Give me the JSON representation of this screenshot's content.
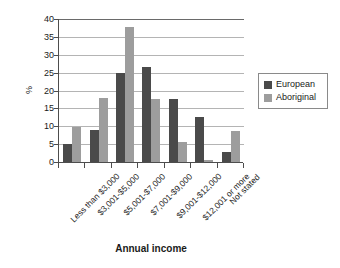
{
  "chart_data": {
    "type": "bar",
    "title": "",
    "xlabel": "Annual income",
    "ylabel": "%",
    "ylim": [
      0,
      40
    ],
    "yticks": [
      0,
      5,
      10,
      15,
      20,
      25,
      30,
      35,
      40
    ],
    "grid": true,
    "legend_position": "right",
    "categories": [
      "Less than $3,000",
      "$3,001-$5,000",
      "$5,001-$7,000",
      "$7,001-$9,000",
      "$9,001-$12,000",
      "$12,001 or more",
      "Not stated"
    ],
    "series": [
      {
        "name": "European",
        "color": "#4a4a4a",
        "values": [
          5.0,
          8.9,
          24.9,
          26.7,
          17.7,
          12.6,
          2.7
        ]
      },
      {
        "name": "Aboriginal",
        "color": "#9d9d9d",
        "values": [
          9.9,
          17.8,
          37.7,
          17.7,
          5.7,
          0.7,
          8.7
        ]
      }
    ]
  },
  "legend": {
    "entries": [
      {
        "label": "European"
      },
      {
        "label": "Aboriginal"
      }
    ]
  }
}
